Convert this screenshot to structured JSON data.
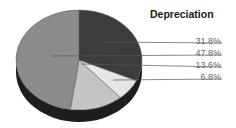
{
  "chart_data": {
    "type": "pie",
    "title": "Depreciation",
    "style": "3d",
    "slices": [
      {
        "label": "31.8%",
        "value": 31.8,
        "color": "#3c3c3c"
      },
      {
        "label": "6.8%",
        "value": 6.8,
        "color": "#e6e6e6"
      },
      {
        "label": "13.6%",
        "value": 13.6,
        "color": "#c4c4c4"
      },
      {
        "label": "47.8%",
        "value": 47.8,
        "color": "#8c8c8c"
      }
    ],
    "legend_order": [
      "31.8%",
      "47.8%",
      "13.6%",
      "6.8%"
    ]
  }
}
